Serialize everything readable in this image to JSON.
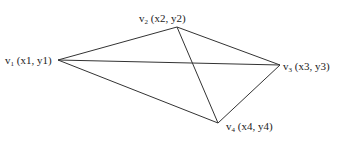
{
  "vertices": [
    {
      "id": "v1",
      "name": "v",
      "sub": "1",
      "coords": "(x1, y1)",
      "x": 58,
      "y": 60
    },
    {
      "id": "v2",
      "name": "v",
      "sub": "2",
      "coords": "(x2, y2)",
      "x": 177,
      "y": 27
    },
    {
      "id": "v3",
      "name": "v",
      "sub": "3",
      "coords": "(x3, y3)",
      "x": 280,
      "y": 65
    },
    {
      "id": "v4",
      "name": "v",
      "sub": "4",
      "coords": "(x4, y4)",
      "x": 218,
      "y": 123
    }
  ],
  "edges": [
    [
      "v1",
      "v2"
    ],
    [
      "v1",
      "v3"
    ],
    [
      "v1",
      "v4"
    ],
    [
      "v2",
      "v3"
    ],
    [
      "v2",
      "v4"
    ],
    [
      "v3",
      "v4"
    ]
  ],
  "line_color": "#333333"
}
